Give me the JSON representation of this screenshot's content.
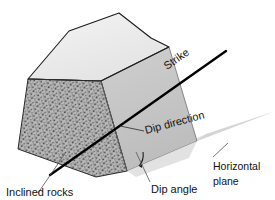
{
  "diagram": {
    "type": "geological-block-diagram",
    "background_color": "#ffffff"
  },
  "labels": {
    "strike": "Strike",
    "dip_direction": "Dip direction",
    "dip_angle": "Dip angle",
    "inclined_rocks": "Inclined rocks",
    "horizontal_plane_line1": "Horizontal",
    "horizontal_plane_line2": "plane"
  },
  "colors": {
    "outline": "#1a1a1a",
    "strike_line": "#000000",
    "top_face": "#ededed",
    "dipping_face": "#c9c9c9",
    "dipping_face_lower": "#d6d6d6",
    "rock_face": "#b4b4b4",
    "rock_speckle": "#4a4a4a",
    "horizontal_plane": "#d9d9d9",
    "leader_line": "#555555",
    "text": "#111111"
  },
  "geometry": {
    "block_top_face": "28,78 68,30 118,13 150,38 168,46 100,80",
    "block_rock_face": "28,78 100,80 96,162 18,148",
    "block_dipping_face": "100,80 168,46 196,141 127,170",
    "horizontal_plane": "127,170 196,141 272,112 206,133",
    "strike_line_start": [
      50,
      174
    ],
    "strike_line_end": [
      226,
      51
    ],
    "dip_angle_arc_center": [
      131,
      160
    ]
  },
  "elements": {
    "strike_line_name": "strike-line",
    "dip_arc_name": "dip-angle-arc",
    "rock_texture_name": "rock-stipple-texture"
  }
}
